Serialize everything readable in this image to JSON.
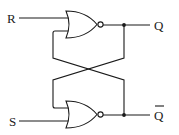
{
  "diagram": {
    "type": "SR latch (NOR gates)",
    "inputs": {
      "reset_label": "R",
      "set_label": "S"
    },
    "outputs": {
      "q_label": "Q",
      "q_bar_label": "Q"
    },
    "gates": [
      {
        "name": "top-nor-gate",
        "type": "NOR"
      },
      {
        "name": "bottom-nor-gate",
        "type": "NOR"
      }
    ],
    "colors": {
      "line": "#1a1a1a",
      "background": "#ffffff"
    }
  }
}
